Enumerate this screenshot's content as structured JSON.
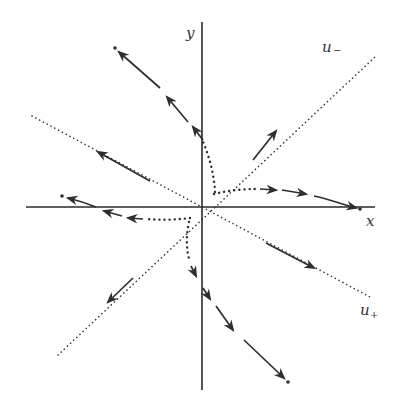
{
  "figure": {
    "type": "phase-portrait",
    "labels": {
      "x_axis": "x",
      "y_axis": "y",
      "eigenvector_minus": "u",
      "eigenvector_minus_sub": "−",
      "eigenvector_plus": "u",
      "eigenvector_plus_sub": "+"
    },
    "colors": {
      "ink": "#2e2e2e",
      "background": "#ffffff"
    },
    "origin_px": [
      202,
      207
    ],
    "eigenlines": [
      {
        "name": "u-",
        "from": [
          58,
          355
        ],
        "to": [
          375,
          57
        ],
        "style": "dotted",
        "flow": "outward"
      },
      {
        "name": "u+",
        "from": [
          32,
          116
        ],
        "to": [
          370,
          297
        ],
        "style": "dotted",
        "flow": "outward"
      }
    ],
    "trajectories": [
      {
        "name": "upper-left",
        "direction": "up-left",
        "arrow_count": 3
      },
      {
        "name": "right",
        "direction": "right",
        "arrow_count": 3
      },
      {
        "name": "left",
        "direction": "left",
        "arrow_count": 3
      },
      {
        "name": "lower-right",
        "direction": "down-right",
        "arrow_count": 3
      }
    ]
  }
}
